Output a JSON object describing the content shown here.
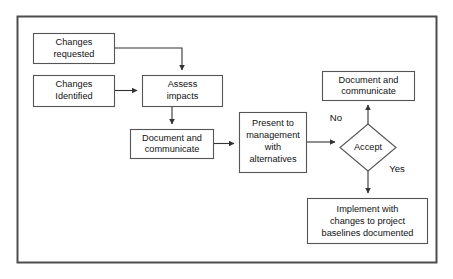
{
  "diagram": {
    "frame": {
      "stroke": "#4d4d4d",
      "fill": "#ffffff"
    },
    "node_stroke": "#555555",
    "node_fill": "#ffffff",
    "text_color": "#111111",
    "nodes": [
      {
        "id": "changes-requested",
        "shape": "rect",
        "lines": [
          "Changes",
          "requested"
        ],
        "x": 33,
        "y": 33,
        "w": 81,
        "h": 30
      },
      {
        "id": "changes-identified",
        "shape": "rect",
        "lines": [
          "Changes",
          "Identified"
        ],
        "x": 33,
        "y": 75,
        "w": 81,
        "h": 31
      },
      {
        "id": "assess-impacts",
        "shape": "rect",
        "lines": [
          "Assess",
          "impacts"
        ],
        "x": 142,
        "y": 75,
        "w": 80,
        "h": 31
      },
      {
        "id": "document-and-communicate-1",
        "shape": "rect",
        "lines": [
          "Document and",
          "communicate"
        ],
        "x": 130,
        "y": 129,
        "w": 83,
        "h": 29
      },
      {
        "id": "present-to-management",
        "shape": "rect",
        "lines": [
          "Present to",
          "management",
          "with",
          "alternatives"
        ],
        "x": 239,
        "y": 112,
        "w": 67,
        "h": 60
      },
      {
        "id": "accept-decision",
        "shape": "diamond",
        "lines": [
          "Accept"
        ],
        "x": 340,
        "y": 124,
        "w": 56,
        "h": 47
      },
      {
        "id": "document-and-communicate-2",
        "shape": "rect",
        "lines": [
          "Document and",
          "communicate"
        ],
        "x": 322,
        "y": 71,
        "w": 92,
        "h": 29
      },
      {
        "id": "implement-with-changes",
        "shape": "rect",
        "lines": [
          "Implement with",
          "changes to project",
          "baselines documented"
        ],
        "x": 307,
        "y": 198,
        "w": 120,
        "h": 45
      }
    ],
    "edge_labels": [
      {
        "id": "label-no",
        "text": "No",
        "x": 336,
        "y": 118
      },
      {
        "id": "label-yes",
        "text": "Yes",
        "x": 396,
        "y": 168
      }
    ],
    "edges": [
      {
        "id": "edge-requested-to-assess",
        "from": "changes-requested",
        "to": "assess-impacts"
      },
      {
        "id": "edge-identified-to-assess",
        "from": "changes-identified",
        "to": "assess-impacts"
      },
      {
        "id": "edge-assess-to-document",
        "from": "assess-impacts",
        "to": "document-and-communicate-1"
      },
      {
        "id": "edge-document-to-present",
        "from": "document-and-communicate-1",
        "to": "present-to-management"
      },
      {
        "id": "edge-present-to-accept",
        "from": "present-to-management",
        "to": "accept-decision"
      },
      {
        "id": "edge-accept-no-to-document",
        "from": "accept-decision",
        "to": "document-and-communicate-2",
        "label": "No"
      },
      {
        "id": "edge-accept-yes-to-implement",
        "from": "accept-decision",
        "to": "implement-with-changes",
        "label": "Yes"
      }
    ]
  }
}
